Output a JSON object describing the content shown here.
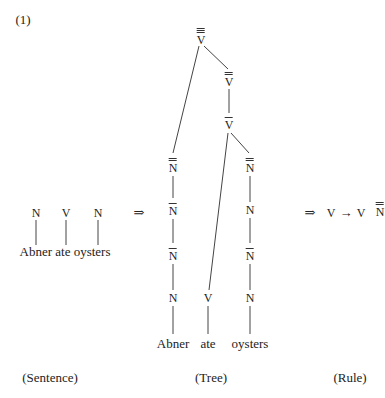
{
  "example_number": "(1)",
  "sentence": {
    "categories": [
      "N",
      "V",
      "N"
    ],
    "words": "Abner ate oysters",
    "caption": "(Sentence)"
  },
  "arrow1": "⇒",
  "tree": {
    "nodes": {
      "v3": {
        "label": "V",
        "bars": 3
      },
      "v2": {
        "label": "V",
        "bars": 2
      },
      "v1": {
        "label": "V",
        "bars": 1
      },
      "n_left_2": {
        "label": "N",
        "bars": 2
      },
      "n_left_1a": {
        "label": "N",
        "bars": 1
      },
      "n_left_1b": {
        "label": "N",
        "bars": 1
      },
      "n_left_0": {
        "label": "N",
        "bars": 0
      },
      "v0": {
        "label": "V",
        "bars": 0
      },
      "n_right_2": {
        "label": "N",
        "bars": 2
      },
      "n_right_0a": {
        "label": "N",
        "bars": 0
      },
      "n_right_1": {
        "label": "N",
        "bars": 1
      },
      "n_right_0b": {
        "label": "N",
        "bars": 0
      }
    },
    "words": [
      "Abner",
      "ate",
      "oysters"
    ],
    "caption": "(Tree)"
  },
  "arrow2": "⇒",
  "rule": {
    "lhs": "V",
    "arrow": "→",
    "rhs_head": "V",
    "rhs_complement": "N",
    "rhs_complement_bars": 2,
    "caption": "(Rule)"
  },
  "colors": {
    "ink": "#222222",
    "background": "#ffffff"
  }
}
